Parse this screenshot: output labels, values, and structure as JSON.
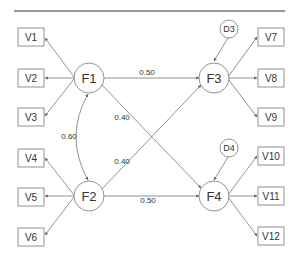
{
  "diagram": {
    "type": "structural-equation-model",
    "colors": {
      "stroke": "#666666",
      "text": "#333333",
      "background": "#ffffff",
      "rule": "#333333"
    },
    "factors": [
      {
        "id": "F1",
        "label": "F1"
      },
      {
        "id": "F2",
        "label": "F2"
      },
      {
        "id": "F3",
        "label": "F3"
      },
      {
        "id": "F4",
        "label": "F4"
      }
    ],
    "disturbances": [
      {
        "id": "D3",
        "label": "D3",
        "target": "F3"
      },
      {
        "id": "D4",
        "label": "D4",
        "target": "F4"
      }
    ],
    "indicators": [
      {
        "id": "V1",
        "label": "V1",
        "factor": "F1"
      },
      {
        "id": "V2",
        "label": "V2",
        "factor": "F1"
      },
      {
        "id": "V3",
        "label": "V3",
        "factor": "F1"
      },
      {
        "id": "V4",
        "label": "V4",
        "factor": "F2"
      },
      {
        "id": "V5",
        "label": "V5",
        "factor": "F2"
      },
      {
        "id": "V6",
        "label": "V6",
        "factor": "F2"
      },
      {
        "id": "V7",
        "label": "V7",
        "factor": "F3"
      },
      {
        "id": "V8",
        "label": "V8",
        "factor": "F3"
      },
      {
        "id": "V9",
        "label": "V9",
        "factor": "F3"
      },
      {
        "id": "V10",
        "label": "V10",
        "factor": "F4"
      },
      {
        "id": "V11",
        "label": "V11",
        "factor": "F4"
      },
      {
        "id": "V12",
        "label": "V12",
        "factor": "F4"
      }
    ],
    "paths": [
      {
        "from": "F1",
        "to": "F3",
        "label": "0.50"
      },
      {
        "from": "F1",
        "to": "F4",
        "label": "0.40"
      },
      {
        "from": "F2",
        "to": "F3",
        "label": "0.40"
      },
      {
        "from": "F2",
        "to": "F4",
        "label": "0.50"
      }
    ],
    "covariances": [
      {
        "between": [
          "F1",
          "F2"
        ],
        "label": "0.60"
      }
    ]
  }
}
